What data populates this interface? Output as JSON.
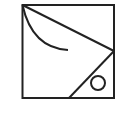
{
  "diagram": {
    "stroke_color": "#222222",
    "background": "#ffffff",
    "shapes": [
      {
        "type": "square",
        "x": 22,
        "y": 5,
        "width": 92,
        "height": 93
      },
      {
        "type": "line",
        "from": [
          22,
          5
        ],
        "to": [
          114,
          51
        ]
      },
      {
        "type": "arc",
        "from": [
          22,
          5
        ],
        "to": [
          68,
          50
        ]
      },
      {
        "type": "line",
        "from": [
          114,
          51
        ],
        "to": [
          69,
          98
        ]
      },
      {
        "type": "circle",
        "cx": 98,
        "cy": 83,
        "r": 7
      }
    ]
  }
}
